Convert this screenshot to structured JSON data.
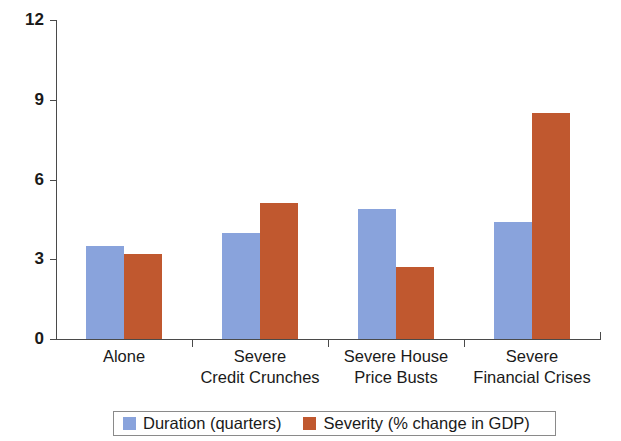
{
  "chart_data": {
    "type": "bar",
    "title": "",
    "xlabel": "",
    "ylabel": "",
    "ylim": [
      0,
      12
    ],
    "yticks": [
      0,
      3,
      6,
      9,
      12
    ],
    "grid": false,
    "legend_position": "bottom",
    "categories": [
      "Alone",
      "Severe\nCredit Crunches",
      "Severe House\nPrice Busts",
      "Severe\nFinancial Crises"
    ],
    "series": [
      {
        "name": "Duration (quarters)",
        "color": "#89a3dc",
        "values": [
          3.5,
          4.0,
          4.9,
          4.4
        ]
      },
      {
        "name": "Severity (% change in GDP)",
        "color": "#c0582f",
        "values": [
          3.2,
          5.1,
          2.7,
          8.5
        ]
      }
    ]
  },
  "axis": {
    "tick_labels": [
      "12",
      "9",
      "6",
      "3",
      "0"
    ]
  },
  "legend": {
    "items": [
      {
        "label": "Duration (quarters)"
      },
      {
        "label": "Severity (% change in GDP)"
      }
    ]
  }
}
